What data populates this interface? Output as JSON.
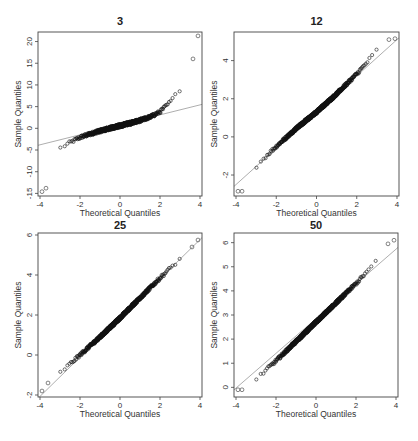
{
  "figure": {
    "layout": "2x2 grid of normal Q-Q plots",
    "panels": [
      {
        "title": "3",
        "xlabel": "Theoretical Quantiles",
        "ylabel": "Sample Quantiles",
        "xticks": [
          -4,
          -2,
          0,
          2,
          4
        ],
        "yticks": [
          -15,
          -10,
          -5,
          0,
          5,
          10,
          15,
          20
        ],
        "xlim": [
          -4.1,
          4.1
        ],
        "ylim": [
          -15.6,
          22.2
        ]
      },
      {
        "title": "12",
        "xlabel": "Theoretical Quantiles",
        "ylabel": "Sample Quantiles",
        "xticks": [
          -4,
          -2,
          0,
          2,
          4
        ],
        "yticks": [
          -2,
          0,
          2,
          4
        ],
        "xlim": [
          -4.1,
          4.1
        ],
        "ylim": [
          -3.1,
          5.5
        ]
      },
      {
        "title": "25",
        "xlabel": "Theoretical Quantiles",
        "ylabel": "Sample Quantiles",
        "xticks": [
          -4,
          -2,
          0,
          2,
          4
        ],
        "yticks": [
          -2,
          0,
          2,
          4,
          6
        ],
        "xlim": [
          -4.1,
          4.1
        ],
        "ylim": [
          -2.1,
          6.1
        ]
      },
      {
        "title": "50",
        "xlabel": "Theoretical Quantiles",
        "ylabel": "Sample Quantiles",
        "xticks": [
          -4,
          -2,
          0,
          2,
          4
        ],
        "yticks": [
          0,
          1,
          2,
          3,
          4,
          5,
          6
        ],
        "xlim": [
          -4.1,
          4.1
        ],
        "ylim": [
          -0.4,
          6.4
        ]
      }
    ]
  },
  "chart_data": [
    {
      "type": "scatter",
      "title": "3",
      "xlabel": "Theoretical Quantiles",
      "ylabel": "Sample Quantiles",
      "xlim": [
        -4.1,
        4.1
      ],
      "ylim": [
        -15.6,
        22.2
      ],
      "grid": false,
      "reference_line": {
        "slope": 1.15,
        "intercept": 0.8
      },
      "description": "Heavy-tailed S-shaped Q-Q curve; points lie below line on left tail and above on right tail",
      "points": [
        [
          -3.9,
          -14.6
        ],
        [
          -3.7,
          -13.8
        ],
        [
          -3.5,
          -6.6
        ],
        [
          -3.3,
          -5.6
        ],
        [
          -3.0,
          -4.6
        ],
        [
          -2.5,
          -3.3
        ],
        [
          -2.0,
          -2.1
        ],
        [
          -1.5,
          -1.3
        ],
        [
          -1.0,
          -0.6
        ],
        [
          -0.5,
          0.0
        ],
        [
          0.0,
          0.6
        ],
        [
          0.5,
          1.2
        ],
        [
          1.0,
          1.8
        ],
        [
          1.5,
          2.6
        ],
        [
          2.0,
          3.8
        ],
        [
          2.5,
          6.0
        ],
        [
          3.0,
          9.0
        ],
        [
          3.2,
          10.5
        ],
        [
          3.4,
          11.5
        ],
        [
          3.55,
          15.7
        ],
        [
          3.65,
          16.0
        ],
        [
          3.9,
          21.3
        ]
      ]
    },
    {
      "type": "scatter",
      "title": "12",
      "xlabel": "Theoretical Quantiles",
      "ylabel": "Sample Quantiles",
      "xlim": [
        -4.1,
        4.1
      ],
      "ylim": [
        -3.1,
        5.5
      ],
      "grid": false,
      "reference_line": {
        "slope": 0.95,
        "intercept": 1.3
      },
      "description": "Nearly linear with slight right skew; tails deviate modestly",
      "points": [
        [
          -3.9,
          -2.85
        ],
        [
          -3.7,
          -2.85
        ],
        [
          -3.5,
          -2.3
        ],
        [
          -3.2,
          -2.0
        ],
        [
          -3.0,
          -1.55
        ],
        [
          -2.5,
          -1.0
        ],
        [
          -2.0,
          -0.5
        ],
        [
          -1.0,
          0.45
        ],
        [
          0.0,
          1.3
        ],
        [
          1.0,
          2.25
        ],
        [
          2.0,
          3.3
        ],
        [
          2.5,
          3.9
        ],
        [
          3.0,
          4.55
        ],
        [
          3.3,
          4.9
        ],
        [
          3.6,
          5.1
        ],
        [
          3.9,
          5.15
        ]
      ]
    },
    {
      "type": "scatter",
      "title": "25",
      "xlabel": "Theoretical Quantiles",
      "ylabel": "Sample Quantiles",
      "xlim": [
        -4.1,
        4.1
      ],
      "ylim": [
        -2.1,
        6.1
      ],
      "grid": false,
      "reference_line": {
        "slope": 0.98,
        "intercept": 1.85
      },
      "description": "Points follow reference line closely",
      "points": [
        [
          -3.9,
          -1.8
        ],
        [
          -3.6,
          -1.4
        ],
        [
          -3.3,
          -1.1
        ],
        [
          -3.0,
          -0.9
        ],
        [
          -2.0,
          0.0
        ],
        [
          -1.0,
          0.9
        ],
        [
          0.0,
          1.85
        ],
        [
          1.0,
          2.85
        ],
        [
          2.0,
          3.85
        ],
        [
          3.0,
          4.8
        ],
        [
          3.3,
          5.1
        ],
        [
          3.6,
          5.4
        ],
        [
          3.9,
          5.75
        ]
      ]
    },
    {
      "type": "scatter",
      "title": "50",
      "xlabel": "Theoretical Quantiles",
      "ylabel": "Sample Quantiles",
      "xlim": [
        -4.1,
        4.1
      ],
      "ylim": [
        -0.4,
        6.4
      ],
      "grid": false,
      "reference_line": {
        "slope": 0.72,
        "intercept": 2.85
      },
      "description": "Points follow reference line closely; near-normal",
      "points": [
        [
          -3.9,
          -0.1
        ],
        [
          -3.7,
          -0.1
        ],
        [
          -3.5,
          0.0
        ],
        [
          -3.3,
          0.1
        ],
        [
          -3.1,
          0.25
        ],
        [
          -2.0,
          1.1
        ],
        [
          -1.0,
          1.9
        ],
        [
          0.0,
          2.7
        ],
        [
          1.0,
          3.5
        ],
        [
          2.0,
          4.3
        ],
        [
          3.0,
          5.2
        ],
        [
          3.3,
          5.6
        ],
        [
          3.6,
          5.95
        ],
        [
          3.9,
          6.1
        ]
      ]
    }
  ]
}
